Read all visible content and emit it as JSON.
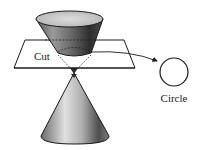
{
  "diagram": {
    "labels": {
      "cut": "Cut",
      "circle": "Circle"
    },
    "colors": {
      "stroke": "#1a1a1a",
      "cone_dark": "#3a3a3a",
      "cone_light": "#d8d8d8",
      "ellipse_top": "#c9c9c9",
      "plane_fill": "#ffffff",
      "background": "#ffffff"
    },
    "shapes": {
      "upper_cone": "inverted cone (nappe) truncated by plane",
      "lower_cone": "upright cone (nappe)",
      "plane": "horizontal cutting plane",
      "result": "circle"
    }
  }
}
